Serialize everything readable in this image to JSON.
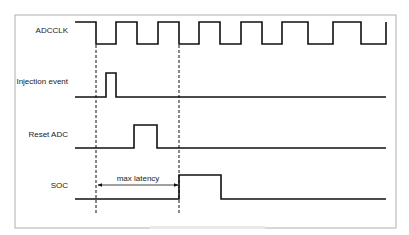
{
  "diagram": {
    "type": "timing-diagram",
    "frame": {
      "x": 15,
      "y": 15,
      "width": 381,
      "height": 213,
      "stroke": "#b0b0b0"
    },
    "line_color": "#111111",
    "signals": [
      {
        "name": "ADCCLK",
        "label_y": 33,
        "high_y": 22,
        "low_y": 44,
        "points": [
          [
            75,
            22
          ],
          [
            96,
            22
          ],
          [
            96,
            44
          ],
          [
            116,
            44
          ],
          [
            116,
            22
          ],
          [
            137,
            22
          ],
          [
            137,
            44
          ],
          [
            158,
            44
          ],
          [
            158,
            22
          ],
          [
            179,
            22
          ],
          [
            179,
            44
          ],
          [
            199,
            44
          ],
          [
            199,
            22
          ],
          [
            220,
            22
          ],
          [
            220,
            44
          ],
          [
            241,
            44
          ],
          [
            241,
            22
          ],
          [
            262,
            22
          ],
          [
            262,
            44
          ],
          [
            282,
            44
          ],
          [
            282,
            22
          ],
          [
            308,
            22
          ],
          [
            308,
            44
          ],
          [
            333,
            44
          ],
          [
            333,
            22
          ],
          [
            361,
            22
          ],
          [
            361,
            44
          ],
          [
            386,
            44
          ],
          [
            386,
            22
          ]
        ]
      },
      {
        "name": "Injection event",
        "label_y": 84,
        "points": [
          [
            75,
            97
          ],
          [
            106,
            97
          ],
          [
            106,
            73
          ],
          [
            116,
            73
          ],
          [
            116,
            97
          ],
          [
            386,
            97
          ]
        ]
      },
      {
        "name": "Reset ADC",
        "label_y": 137,
        "points": [
          [
            75,
            148
          ],
          [
            134,
            148
          ],
          [
            134,
            125
          ],
          [
            157,
            125
          ],
          [
            157,
            148
          ],
          [
            386,
            148
          ]
        ]
      },
      {
        "name": "SOC",
        "label_y": 188,
        "points": [
          [
            75,
            199
          ],
          [
            179,
            199
          ],
          [
            179,
            175
          ],
          [
            221,
            175
          ],
          [
            221,
            199
          ],
          [
            386,
            199
          ]
        ]
      }
    ],
    "markers": [
      {
        "type": "dashed-line",
        "x": 96,
        "y1": 45,
        "y2": 215
      },
      {
        "type": "dashed-line",
        "x": 179,
        "y1": 45,
        "y2": 215
      }
    ],
    "annotation": {
      "text": "max latency",
      "arrow": {
        "x1": 98,
        "x2": 178,
        "y": 185
      },
      "text_x": 138,
      "text_y": 181
    }
  }
}
